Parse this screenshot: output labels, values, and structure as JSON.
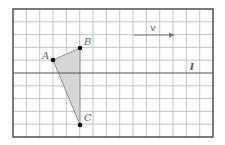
{
  "diagram": {
    "type": "coordinate-grid-geometry",
    "grid": {
      "columns": 15,
      "rows": 10,
      "line_color": "#b5b5b5",
      "frame_color": "#444444"
    },
    "points": [
      {
        "name": "A",
        "label": "A",
        "x": 53,
        "y": 60
      },
      {
        "name": "B",
        "label": "B",
        "x": 80,
        "y": 48
      },
      {
        "name": "C",
        "label": "C",
        "x": 80,
        "y": 125
      }
    ],
    "triangle": {
      "vertices": [
        "A",
        "B",
        "C"
      ],
      "fill": "#d9d9d9"
    },
    "vector": {
      "label": "v",
      "x1": 134,
      "y1": 35,
      "x2": 174,
      "y2": 35
    },
    "line": {
      "label": "l",
      "y": 73
    }
  }
}
